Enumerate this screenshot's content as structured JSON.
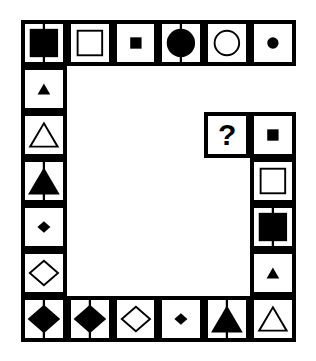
{
  "puzzle": {
    "title": "Shape Matrix Puzzle",
    "type": "visual-analogy-matrix",
    "question_marker": "?",
    "grid": {
      "columns": 6,
      "rows": 7,
      "border_color": "#000000",
      "fill_color": "#000000",
      "background_color": "#ffffff",
      "line_width_outer": 5,
      "line_width_inner": 4
    },
    "geometry": {
      "origin_x": 21,
      "origin_y": 20,
      "cell_width": 45.8,
      "cell_height": 46.0
    },
    "legend": {
      "shapes": [
        "square",
        "circle",
        "triangle",
        "diamond"
      ],
      "sizes": [
        "small",
        "medium",
        "large"
      ],
      "fills": [
        "filled",
        "outline"
      ],
      "modifiers": [
        "vertical-line",
        "none"
      ]
    },
    "cells": [
      {
        "id": "r1c1",
        "row": 1,
        "col": 1,
        "shape": "square",
        "size": "large",
        "fill": "filled",
        "line": true,
        "label": "large filled square with vertical line"
      },
      {
        "id": "r1c2",
        "row": 1,
        "col": 2,
        "shape": "square",
        "size": "medium",
        "fill": "outline",
        "line": false,
        "label": "medium outlined square"
      },
      {
        "id": "r1c3",
        "row": 1,
        "col": 3,
        "shape": "square",
        "size": "small",
        "fill": "filled",
        "line": false,
        "label": "small filled square"
      },
      {
        "id": "r1c4",
        "row": 1,
        "col": 4,
        "shape": "circle",
        "size": "large",
        "fill": "filled",
        "line": true,
        "label": "large filled circle with vertical line"
      },
      {
        "id": "r1c5",
        "row": 1,
        "col": 5,
        "shape": "circle",
        "size": "medium",
        "fill": "outline",
        "line": false,
        "label": "medium outlined circle"
      },
      {
        "id": "r1c6",
        "row": 1,
        "col": 6,
        "shape": "circle",
        "size": "small",
        "fill": "filled",
        "line": false,
        "label": "small filled circle"
      },
      {
        "id": "r2c1",
        "row": 2,
        "col": 1,
        "shape": "triangle",
        "size": "small",
        "fill": "filled",
        "line": false,
        "label": "small filled triangle"
      },
      {
        "id": "r3c1",
        "row": 3,
        "col": 1,
        "shape": "triangle",
        "size": "medium",
        "fill": "outline",
        "line": false,
        "label": "medium outlined triangle"
      },
      {
        "id": "r3c5",
        "row": 3,
        "col": 5,
        "shape": "question",
        "size": "medium",
        "fill": "none",
        "line": false,
        "label": "question mark (missing tile)"
      },
      {
        "id": "r3c6",
        "row": 3,
        "col": 6,
        "shape": "square",
        "size": "small",
        "fill": "filled",
        "line": false,
        "label": "small filled square"
      },
      {
        "id": "r4c1",
        "row": 4,
        "col": 1,
        "shape": "triangle",
        "size": "large",
        "fill": "filled",
        "line": true,
        "label": "large filled triangle with vertical line"
      },
      {
        "id": "r4c6",
        "row": 4,
        "col": 6,
        "shape": "square",
        "size": "medium",
        "fill": "outline",
        "line": false,
        "label": "medium outlined square"
      },
      {
        "id": "r5c1",
        "row": 5,
        "col": 1,
        "shape": "diamond",
        "size": "small",
        "fill": "filled",
        "line": false,
        "label": "small filled diamond"
      },
      {
        "id": "r5c6",
        "row": 5,
        "col": 6,
        "shape": "square",
        "size": "large",
        "fill": "filled",
        "line": true,
        "label": "large filled square with vertical line"
      },
      {
        "id": "r6c1",
        "row": 6,
        "col": 1,
        "shape": "diamond",
        "size": "medium",
        "fill": "outline",
        "line": false,
        "label": "medium outlined diamond"
      },
      {
        "id": "r6c6",
        "row": 6,
        "col": 6,
        "shape": "triangle",
        "size": "small",
        "fill": "filled",
        "line": false,
        "label": "small filled triangle"
      },
      {
        "id": "r7c1",
        "row": 7,
        "col": 1,
        "shape": "diamond",
        "size": "large",
        "fill": "filled",
        "line": true,
        "label": "large filled diamond with vertical line"
      },
      {
        "id": "r7c2",
        "row": 7,
        "col": 2,
        "shape": "diamond",
        "size": "large",
        "fill": "filled",
        "line": true,
        "label": "large filled diamond with vertical line"
      },
      {
        "id": "r7c3",
        "row": 7,
        "col": 3,
        "shape": "diamond",
        "size": "medium",
        "fill": "outline",
        "line": false,
        "label": "medium outlined diamond"
      },
      {
        "id": "r7c4",
        "row": 7,
        "col": 4,
        "shape": "diamond",
        "size": "small",
        "fill": "filled",
        "line": false,
        "label": "small filled diamond"
      },
      {
        "id": "r7c5",
        "row": 7,
        "col": 5,
        "shape": "triangle",
        "size": "large",
        "fill": "filled",
        "line": true,
        "label": "large filled triangle with vertical line"
      },
      {
        "id": "r7c6",
        "row": 7,
        "col": 6,
        "shape": "triangle",
        "size": "medium",
        "fill": "outline",
        "line": false,
        "label": "medium outlined triangle"
      }
    ]
  }
}
